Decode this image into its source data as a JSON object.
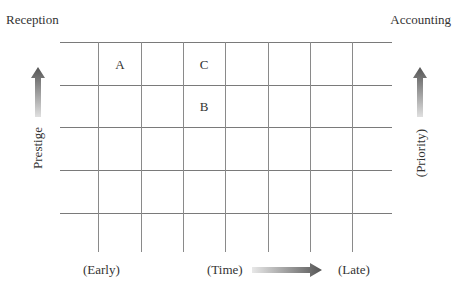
{
  "corners": {
    "top_left": "Reception",
    "top_right": "Accounting"
  },
  "axes": {
    "left_label": "Prestige",
    "right_label": "(Priority)",
    "bottom_left": "(Early)",
    "bottom_center": "(Time)",
    "bottom_right": "(Late)"
  },
  "grid": {
    "rows": 5,
    "columns": 7,
    "line_color": "#7a7a7a"
  },
  "cells": [
    {
      "label": "A",
      "row": 0,
      "col": 1
    },
    {
      "label": "C",
      "row": 0,
      "col": 3
    },
    {
      "label": "B",
      "row": 1,
      "col": 3
    }
  ],
  "arrows": {
    "left": "arrow-up-icon",
    "right": "arrow-up-icon",
    "bottom": "arrow-right-icon",
    "color": "#555555"
  }
}
